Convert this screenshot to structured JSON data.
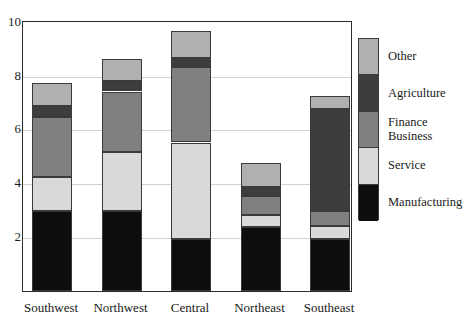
{
  "chart_data": {
    "type": "bar",
    "subtype": "stacked-bar",
    "title": "",
    "xlabel": "",
    "ylabel": "",
    "ylim": [
      0,
      10
    ],
    "yticks": [
      2,
      4,
      6,
      8,
      10
    ],
    "ytick_labels": [
      "2",
      "4",
      "6",
      "8",
      "10"
    ],
    "grid": true,
    "grid_axis": "y",
    "legend_position": "right",
    "categories": [
      "Southwest",
      "Northwest",
      "Central",
      "Northeast",
      "Southeast"
    ],
    "series": [
      {
        "name": "Manufacturing",
        "color": "#0d0d0d",
        "values": [
          3.0,
          3.0,
          1.95,
          2.4,
          1.95
        ]
      },
      {
        "name": "Service",
        "color": "#d9d9d9",
        "values": [
          1.25,
          2.2,
          3.6,
          0.45,
          0.5
        ]
      },
      {
        "name": "Finance Business",
        "color": "#808080",
        "values": [
          2.25,
          2.25,
          2.8,
          0.7,
          0.55
        ]
      },
      {
        "name": "Agriculture",
        "color": "#3d3d3d",
        "values": [
          0.4,
          0.4,
          0.35,
          0.35,
          3.8
        ]
      },
      {
        "name": "Other",
        "color": "#b0b0b0",
        "values": [
          0.85,
          0.8,
          1.0,
          0.9,
          0.5
        ]
      }
    ],
    "totals": [
      7.75,
      8.65,
      9.7,
      4.8,
      7.3
    ]
  },
  "legend": {
    "entries": [
      {
        "label": "Other",
        "label_line2": ""
      },
      {
        "label": "Agriculture",
        "label_line2": ""
      },
      {
        "label": "Finance",
        "label_line2": "Business"
      },
      {
        "label": "Service",
        "label_line2": ""
      },
      {
        "label": "Manufacturing",
        "label_line2": ""
      }
    ]
  },
  "colors": {
    "manufacturing": "#0d0d0d",
    "service": "#d9d9d9",
    "finance_business": "#808080",
    "agriculture": "#3d3d3d",
    "other": "#b0b0b0",
    "frame": "#2b2b2b",
    "grid": "#d2d2d2",
    "text": "#1a1a1a"
  }
}
